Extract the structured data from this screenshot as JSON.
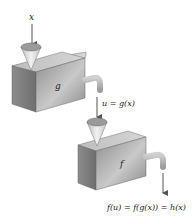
{
  "diagram": {
    "type": "function-composition-machines",
    "input_label": "x",
    "machine_g": {
      "label": "g"
    },
    "intermediate_label": "u = g(x)",
    "machine_f": {
      "label": "f"
    },
    "output_label": "f(u) = f(g(x)) = h(x)"
  },
  "colors": {
    "box_front": "#9a9a9a",
    "box_top": "#c8c8c8",
    "box_side": "#7a7a7a",
    "funnel": "#d8d8d8",
    "arrow": "#555555",
    "text": "#222222"
  }
}
